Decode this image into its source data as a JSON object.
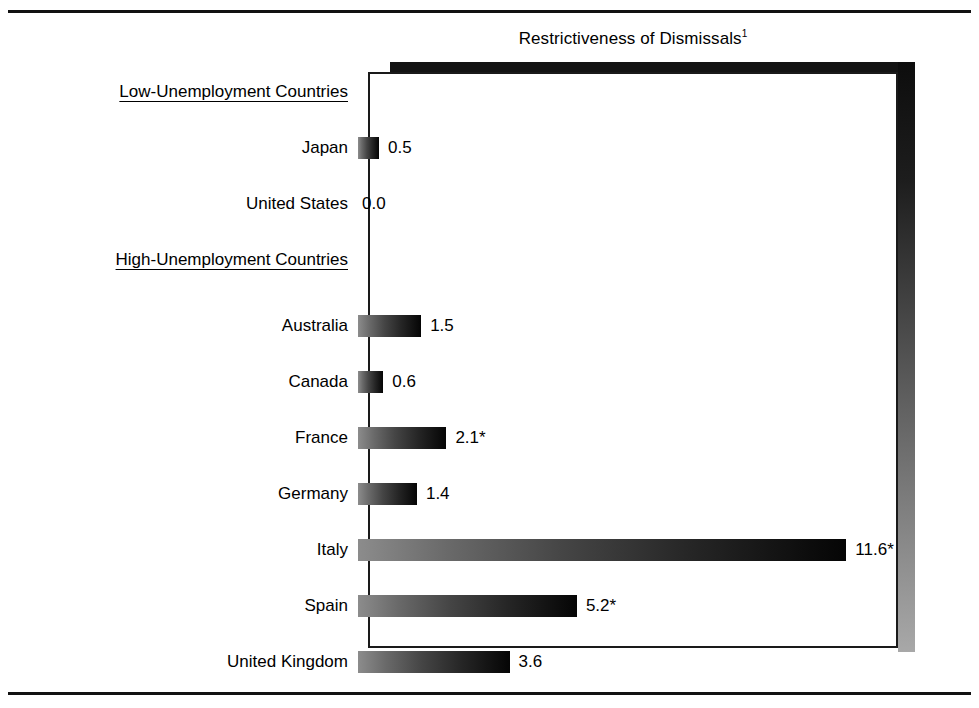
{
  "figure": {
    "title": "Restrictiveness of Dismissals",
    "title_superscript": "1"
  },
  "chart_data": {
    "type": "bar",
    "orientation": "horizontal",
    "xlabel": "",
    "ylabel": "",
    "grid": false,
    "legend": "none",
    "xlim": [
      0,
      12.6
    ],
    "value_label_suffix_note": "* denotes footnoted value",
    "groups": [
      {
        "name": "Low-Unemployment Countries",
        "categories": [
          "Japan",
          "United States"
        ],
        "values": [
          0.5,
          0.0
        ],
        "value_labels": [
          "0.5",
          "0.0"
        ]
      },
      {
        "name": "High-Unemployment Countries",
        "categories": [
          "Australia",
          "Canada",
          "France",
          "Germany",
          "Italy",
          "Spain",
          "United Kingdom"
        ],
        "values": [
          1.5,
          0.6,
          2.1,
          1.4,
          11.6,
          5.2,
          3.6
        ],
        "value_labels": [
          "1.5",
          "0.6",
          "2.1*",
          "1.4",
          "11.6*",
          "5.2*",
          "3.6"
        ]
      }
    ],
    "categories": [
      "Japan",
      "United States",
      "Australia",
      "Canada",
      "France",
      "Germany",
      "Italy",
      "Spain",
      "United Kingdom"
    ],
    "values": [
      0.5,
      0.0,
      1.5,
      0.6,
      2.1,
      1.4,
      11.6,
      5.2,
      3.6
    ]
  },
  "rows": [
    {
      "kind": "group",
      "label": "Low-Unemployment Countries",
      "value": null,
      "value_label": "",
      "top": 0
    },
    {
      "kind": "bar",
      "label": "Japan",
      "value": 0.5,
      "value_label": "0.5",
      "top": 56
    },
    {
      "kind": "bar",
      "label": "United States",
      "value": 0.0,
      "value_label": "0.0",
      "top": 112
    },
    {
      "kind": "group",
      "label": "High-Unemployment Countries",
      "value": null,
      "value_label": "",
      "top": 168
    },
    {
      "kind": "bar",
      "label": "Australia",
      "value": 1.5,
      "value_label": "1.5",
      "top": 234
    },
    {
      "kind": "bar",
      "label": "Canada",
      "value": 0.6,
      "value_label": "0.6",
      "top": 290
    },
    {
      "kind": "bar",
      "label": "France",
      "value": 2.1,
      "value_label": "2.1*",
      "top": 346
    },
    {
      "kind": "bar",
      "label": "Germany",
      "value": 1.4,
      "value_label": "1.4",
      "top": 402
    },
    {
      "kind": "bar",
      "label": "Italy",
      "value": 11.6,
      "value_label": "11.6*",
      "top": 458
    },
    {
      "kind": "bar",
      "label": "Spain",
      "value": 5.2,
      "value_label": "5.2*",
      "top": 514
    },
    {
      "kind": "bar",
      "label": "United Kingdom",
      "value": 3.6,
      "value_label": "3.6",
      "top": 570
    }
  ],
  "scale": {
    "px_per_unit": 42.1
  },
  "colors": {
    "ink": "#000000",
    "frame": "#1a1a1a",
    "shadow_dark": "#131313",
    "bar_light_end": "#8c8c8c",
    "bar_dark_end": "#050505",
    "background": "#ffffff"
  }
}
